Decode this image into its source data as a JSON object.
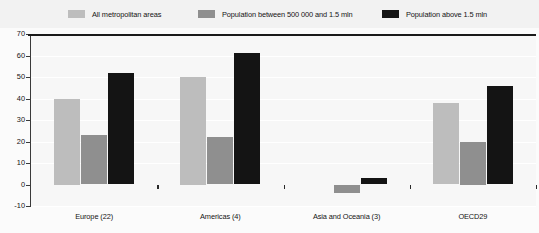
{
  "chart_data": {
    "type": "bar",
    "title": "",
    "subtitle": "",
    "xlabel": "",
    "ylabel": "",
    "ylim": [
      -10,
      70
    ],
    "ytick_step": 10,
    "yticks": [
      70,
      60,
      50,
      40,
      30,
      20,
      10,
      0,
      -10
    ],
    "grid": true,
    "legend_position": "top",
    "categories": [
      "Europe (22)",
      "Americas (4)",
      "Asia and Oceania (3)",
      "OECD29"
    ],
    "series": [
      {
        "name": "All metropolitan areas",
        "color": "#bdbdbd",
        "values": [
          40,
          50,
          0,
          38
        ]
      },
      {
        "name": "Population between 500 000 and 1.5 mln",
        "color": "#8f8f8f",
        "values": [
          23,
          22,
          -4,
          20
        ]
      },
      {
        "name": "Population above 1.5 mln",
        "color": "#141414",
        "values": [
          52,
          61,
          3,
          46
        ]
      }
    ]
  },
  "legend": {
    "items": [
      {
        "label": "All metropolitan areas",
        "swatch": "#bdbdbd"
      },
      {
        "label": "Population between 500 000 and 1.5 mln",
        "swatch": "#8f8f8f"
      },
      {
        "label": "Population above 1.5 mln",
        "swatch": "#141414"
      }
    ]
  }
}
